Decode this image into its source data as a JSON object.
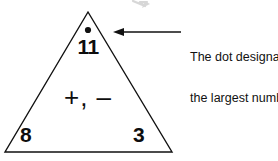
{
  "figure": {
    "type": "fact-triangle",
    "background_color": "#ffffff",
    "ink_color": "#111111",
    "triangle": {
      "apex": [
        88,
        12
      ],
      "bottom_left": [
        5,
        152
      ],
      "bottom_right": [
        172,
        152
      ],
      "stroke_width": 1.4
    },
    "dot": {
      "label": "largest-number-dot",
      "center": [
        88,
        30
      ],
      "radius": 3.1,
      "color": "#111111"
    },
    "numbers": {
      "top": "11",
      "bottom_left": "8",
      "bottom_right": "3"
    },
    "operators": "+, –",
    "annotation": {
      "line1": "The dot designates",
      "line2": "the largest number.",
      "arrow": {
        "tip": [
          113,
          32
        ],
        "tail": [
          181,
          32
        ],
        "direction": "left",
        "stroke_width": 1.5,
        "head_length": 9,
        "head_width": 8
      }
    },
    "stray_mark": {
      "label": "cropped-arrow-artifact",
      "position": [
        133,
        0
      ],
      "color": "#b9b9b9"
    }
  }
}
